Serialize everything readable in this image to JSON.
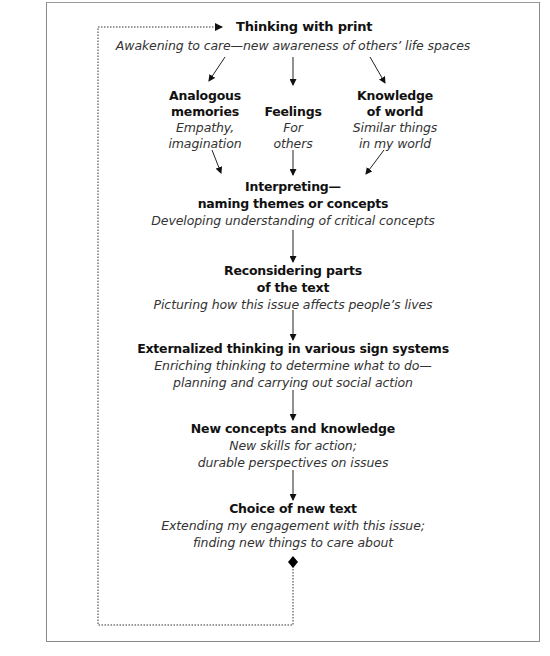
{
  "diagram": {
    "title": "Thinking with print",
    "subtitle": "Awakening to care—new awareness of others’ life spaces",
    "branches": [
      {
        "heading": [
          "Analogous",
          "memories"
        ],
        "detail": [
          "Empathy,",
          "imagination"
        ]
      },
      {
        "heading": [
          "",
          "Feelings"
        ],
        "detail": [
          "For",
          "others"
        ]
      },
      {
        "heading": [
          "Knowledge",
          "of world"
        ],
        "detail": [
          "Similar things",
          "in my world"
        ]
      }
    ],
    "stages": [
      {
        "heading": [
          "Interpreting—",
          "naming themes or concepts"
        ],
        "detail": [
          "Developing understanding of critical concepts"
        ]
      },
      {
        "heading": [
          "Reconsidering parts",
          "of the text"
        ],
        "detail": [
          "Picturing how this issue affects people’s lives"
        ]
      },
      {
        "heading": [
          "Externalized thinking in various sign systems"
        ],
        "detail": [
          "Enriching thinking to determine what to do—",
          "planning and carrying out social action"
        ]
      },
      {
        "heading": [
          "New concepts and knowledge"
        ],
        "detail": [
          "New skills for action;",
          "durable perspectives on issues"
        ]
      },
      {
        "heading": [
          "Choice of new text"
        ],
        "detail": [
          "Extending my engagement with this issue;",
          "finding new things to care about"
        ]
      }
    ],
    "loop": {
      "style": "dotted",
      "start_marker": "diamond",
      "end_marker": "arrow"
    }
  },
  "colors": {
    "frame": "#8a8a8a",
    "lines": "#222222",
    "text": "#111111",
    "detail_text": "#333333"
  }
}
